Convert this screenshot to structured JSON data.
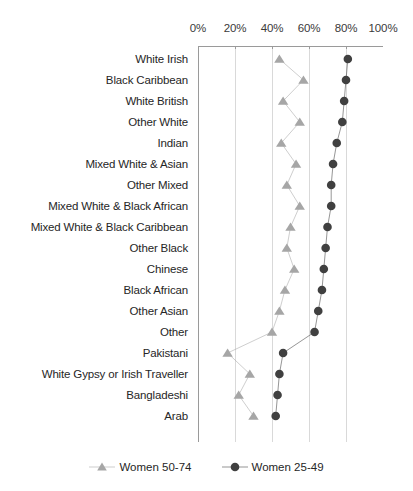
{
  "chart_data": {
    "type": "line",
    "title": "",
    "xlabel": "",
    "ylabel": "",
    "orientation": "horizontal",
    "xlim": [
      0,
      100
    ],
    "xticks": [
      0,
      20,
      40,
      60,
      80,
      100
    ],
    "xtick_labels": [
      "0%",
      "20%",
      "40%",
      "60%",
      "80%",
      "100%"
    ],
    "grid": true,
    "legend_position": "bottom",
    "categories": [
      "White Irish",
      "Black Caribbean",
      "White British",
      "Other White",
      "Indian",
      "Mixed White & Asian",
      "Other Mixed",
      "Mixed White & Black African",
      "Mixed White & Black Caribbean",
      "Other Black",
      "Chinese",
      "Black African",
      "Other Asian",
      "Other",
      "Pakistani",
      "White Gypsy or Irish Traveller",
      "Bangladeshi",
      "Arab"
    ],
    "series": [
      {
        "name": "Women 50-74",
        "marker": "triangle",
        "color": "#a6a6a6",
        "values": [
          44,
          57,
          46,
          55,
          45,
          53,
          48,
          55,
          50,
          48,
          52,
          47,
          44,
          40,
          16,
          28,
          22,
          30
        ]
      },
      {
        "name": "Women 25-49",
        "marker": "circle",
        "color": "#404040",
        "values": [
          81,
          80,
          79,
          78,
          75,
          73,
          72,
          72,
          70,
          69,
          68,
          67,
          65,
          63,
          46,
          44,
          43,
          42
        ]
      }
    ]
  },
  "legend": {
    "entries": [
      {
        "label": "Women 50-74",
        "marker": "triangle-marker-icon",
        "color": "#a6a6a6"
      },
      {
        "label": "Women 25-49",
        "marker": "circle-marker-icon",
        "color": "#404040"
      }
    ]
  },
  "axis": {
    "x_min_label": "0%",
    "x_max_label": "100%"
  }
}
